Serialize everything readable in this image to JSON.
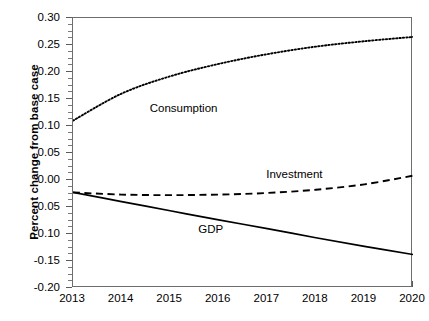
{
  "chart_data": {
    "type": "line",
    "title": "",
    "subtitle": "",
    "xlabel": "",
    "ylabel": "Percent change from base case",
    "x": [
      2013,
      2014,
      2015,
      2016,
      2017,
      2018,
      2019,
      2020
    ],
    "xtick_labels": [
      "2013",
      "2014",
      "2015",
      "2016",
      "2017",
      "2018",
      "2019",
      "2020"
    ],
    "ytick_labels": [
      "0.30",
      "0.25",
      "0.20",
      "0.15",
      "0.10",
      "0.05",
      "0.00",
      "-0.05",
      "-0.10",
      "-0.15",
      "-0.20"
    ],
    "ytick_values": [
      0.3,
      0.25,
      0.2,
      0.15,
      0.1,
      0.05,
      0.0,
      -0.05,
      -0.1,
      -0.15,
      -0.2
    ],
    "xlim": [
      2013,
      2020
    ],
    "ylim": [
      -0.2,
      0.3
    ],
    "grid": false,
    "legend_position": "inline-annotations",
    "minor_ticks_y": true,
    "series": [
      {
        "name": "Consumption",
        "style": "dotted",
        "color": "#000000",
        "values": [
          0.11,
          0.16,
          0.192,
          0.215,
          0.233,
          0.247,
          0.257,
          0.265
        ],
        "label": "Consumption",
        "label_x": 2014.6,
        "label_y": 0.132
      },
      {
        "name": "Investment",
        "style": "dashed",
        "color": "#000000",
        "values": [
          -0.023,
          -0.027,
          -0.028,
          -0.027,
          -0.024,
          -0.018,
          -0.008,
          0.008
        ],
        "label": "Investment",
        "label_x": 2017.0,
        "label_y": 0.009
      },
      {
        "name": "GDP",
        "style": "solid",
        "color": "#000000",
        "values": [
          -0.023,
          -0.04,
          -0.057,
          -0.074,
          -0.09,
          -0.107,
          -0.123,
          -0.138
        ],
        "label": "GDP",
        "label_x": 2015.6,
        "label_y": -0.092
      }
    ]
  },
  "axis": {
    "ylabel": "Percent change from base case"
  }
}
